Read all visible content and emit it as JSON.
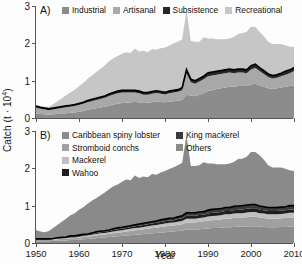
{
  "figure": {
    "ylabel_prefix": "Catch (t · 10",
    "ylabel_exponent": "4",
    "ylabel_suffix": ")",
    "xlabel": "Year",
    "background_color": "#fdfdfd",
    "axis_color": "#555555"
  },
  "panels": [
    {
      "tag": "A)",
      "ytick_labels": [
        "0",
        "1",
        "2",
        "3"
      ],
      "xtick_labels": [
        "1950",
        "1960",
        "1970",
        "1980",
        "1990",
        "2000",
        "2010"
      ],
      "legend_columns": [
        {
          "items": [
            {
              "label": "Industrial",
              "color": "#8c8c8c"
            },
            {
              "label": "Artisanal",
              "color": "#a8a8a8"
            },
            {
              "label": "Subsistence",
              "color": "#262626"
            },
            {
              "label": "Recreational",
              "color": "#c6c6c6"
            }
          ]
        }
      ]
    },
    {
      "tag": "B)",
      "ytick_labels": [
        "0",
        "1",
        "2",
        "3"
      ],
      "xtick_labels": [
        "1950",
        "1960",
        "1970",
        "1980",
        "1990",
        "2000",
        "2010"
      ],
      "legend_columns": [
        {
          "items": [
            {
              "label": "Caribbean spiny lobster",
              "color": "#8c8c8c"
            },
            {
              "label": "Stromboid conchs",
              "color": "#a0a0a0"
            },
            {
              "label": "Mackerel",
              "color": "#c0c0c0"
            },
            {
              "label": "Wahoo",
              "color": "#1f1f1f"
            }
          ]
        },
        {
          "items": [
            {
              "label": "King mackerel",
              "color": "#3a3a3a"
            },
            {
              "label": "Others",
              "color": "#8a8a8a"
            }
          ]
        }
      ]
    }
  ],
  "chart_data": [
    {
      "type": "area",
      "panel": "A",
      "title": "A)",
      "xlabel": "Year",
      "ylabel": "Catch (t · 10^4)",
      "xlim": [
        1950,
        2010
      ],
      "ylim": [
        0,
        3
      ],
      "yticks": [
        0,
        1,
        2,
        3
      ],
      "xticks": [
        1950,
        1960,
        1970,
        1980,
        1990,
        2000,
        2010
      ],
      "grid": false,
      "legend_position": "top",
      "stacked": true,
      "stack_order": [
        "Industrial",
        "Artisanal",
        "Subsistence",
        "Recreational"
      ],
      "x": [
        1950,
        1951,
        1952,
        1953,
        1954,
        1955,
        1956,
        1957,
        1958,
        1959,
        1960,
        1961,
        1962,
        1963,
        1964,
        1965,
        1966,
        1967,
        1968,
        1969,
        1970,
        1971,
        1972,
        1973,
        1974,
        1975,
        1976,
        1977,
        1978,
        1979,
        1980,
        1981,
        1982,
        1983,
        1984,
        1985,
        1986,
        1987,
        1988,
        1989,
        1990,
        1991,
        1992,
        1993,
        1994,
        1995,
        1996,
        1997,
        1998,
        1999,
        2000,
        2001,
        2002,
        2003,
        2004,
        2005,
        2006,
        2007,
        2008,
        2009,
        2010
      ],
      "series": [
        {
          "name": "Industrial",
          "color": "#8c8c8c",
          "values": [
            0.12,
            0.11,
            0.1,
            0.09,
            0.1,
            0.11,
            0.12,
            0.13,
            0.14,
            0.15,
            0.17,
            0.19,
            0.22,
            0.24,
            0.26,
            0.28,
            0.3,
            0.33,
            0.36,
            0.38,
            0.4,
            0.41,
            0.42,
            0.43,
            0.42,
            0.4,
            0.41,
            0.43,
            0.44,
            0.43,
            0.42,
            0.44,
            0.45,
            0.46,
            0.48,
            0.62,
            0.6,
            0.58,
            0.62,
            0.66,
            0.72,
            0.74,
            0.78,
            0.8,
            0.82,
            0.84,
            0.84,
            0.86,
            0.86,
            0.86,
            0.9,
            0.92,
            0.88,
            0.84,
            0.8,
            0.78,
            0.8,
            0.82,
            0.84,
            0.86,
            0.88
          ]
        },
        {
          "name": "Artisanal",
          "color": "#a8a8a8",
          "values": [
            0.16,
            0.14,
            0.13,
            0.12,
            0.13,
            0.14,
            0.15,
            0.16,
            0.16,
            0.17,
            0.18,
            0.19,
            0.2,
            0.21,
            0.22,
            0.23,
            0.24,
            0.26,
            0.27,
            0.28,
            0.28,
            0.27,
            0.26,
            0.25,
            0.24,
            0.22,
            0.21,
            0.22,
            0.23,
            0.22,
            0.21,
            0.22,
            0.23,
            0.24,
            0.26,
            0.58,
            0.36,
            0.34,
            0.36,
            0.38,
            0.4,
            0.4,
            0.38,
            0.38,
            0.38,
            0.38,
            0.36,
            0.36,
            0.36,
            0.34,
            0.4,
            0.42,
            0.38,
            0.34,
            0.3,
            0.28,
            0.28,
            0.3,
            0.32,
            0.34,
            0.38
          ]
        },
        {
          "name": "Subsistence",
          "color": "#262626",
          "values": [
            0.04,
            0.04,
            0.04,
            0.04,
            0.04,
            0.04,
            0.04,
            0.04,
            0.04,
            0.04,
            0.04,
            0.04,
            0.05,
            0.05,
            0.05,
            0.05,
            0.05,
            0.05,
            0.05,
            0.06,
            0.06,
            0.06,
            0.06,
            0.06,
            0.06,
            0.06,
            0.06,
            0.06,
            0.06,
            0.06,
            0.06,
            0.06,
            0.06,
            0.06,
            0.07,
            0.1,
            0.08,
            0.08,
            0.08,
            0.08,
            0.09,
            0.09,
            0.09,
            0.09,
            0.09,
            0.09,
            0.09,
            0.09,
            0.09,
            0.09,
            0.1,
            0.1,
            0.09,
            0.09,
            0.08,
            0.08,
            0.08,
            0.08,
            0.09,
            0.09,
            0.09
          ]
        },
        {
          "name": "Recreational",
          "color": "#c6c6c6",
          "values": [
            0.03,
            0.03,
            0.03,
            0.05,
            0.1,
            0.16,
            0.22,
            0.28,
            0.34,
            0.4,
            0.46,
            0.52,
            0.58,
            0.64,
            0.7,
            0.76,
            0.82,
            0.88,
            0.92,
            0.94,
            0.98,
            1.02,
            1.0,
            1.12,
            1.06,
            1.12,
            1.08,
            1.14,
            1.1,
            1.16,
            1.2,
            1.22,
            1.26,
            1.28,
            1.3,
            1.6,
            1.02,
            1.04,
            0.98,
            1.04,
            0.92,
            0.9,
            0.86,
            0.84,
            0.82,
            0.82,
            0.88,
            0.94,
            0.96,
            1.02,
            1.04,
            1.0,
            0.96,
            0.92,
            0.86,
            0.84,
            0.82,
            0.78,
            0.7,
            0.62,
            0.56
          ]
        }
      ]
    },
    {
      "type": "area",
      "panel": "B",
      "title": "B)",
      "xlabel": "Year",
      "ylabel": "Catch (t · 10^4)",
      "xlim": [
        1950,
        2010
      ],
      "ylim": [
        0,
        3
      ],
      "yticks": [
        0,
        1,
        2,
        3
      ],
      "xticks": [
        1950,
        1960,
        1970,
        1980,
        1990,
        2000,
        2010
      ],
      "grid": false,
      "legend_position": "top",
      "stacked": true,
      "stack_order": [
        "Caribbean spiny lobster",
        "Stromboid conchs",
        "Mackerel",
        "Wahoo",
        "King mackerel",
        "Others"
      ],
      "x": [
        1950,
        1951,
        1952,
        1953,
        1954,
        1955,
        1956,
        1957,
        1958,
        1959,
        1960,
        1961,
        1962,
        1963,
        1964,
        1965,
        1966,
        1967,
        1968,
        1969,
        1970,
        1971,
        1972,
        1973,
        1974,
        1975,
        1976,
        1977,
        1978,
        1979,
        1980,
        1981,
        1982,
        1983,
        1984,
        1985,
        1986,
        1987,
        1988,
        1989,
        1990,
        1991,
        1992,
        1993,
        1994,
        1995,
        1996,
        1997,
        1998,
        1999,
        2000,
        2001,
        2002,
        2003,
        2004,
        2005,
        2006,
        2007,
        2008,
        2009,
        2010
      ],
      "series": [
        {
          "name": "Caribbean spiny lobster",
          "color": "#8c8c8c",
          "values": [
            0.05,
            0.05,
            0.05,
            0.05,
            0.06,
            0.06,
            0.07,
            0.07,
            0.08,
            0.08,
            0.09,
            0.1,
            0.11,
            0.12,
            0.13,
            0.14,
            0.15,
            0.16,
            0.17,
            0.18,
            0.19,
            0.2,
            0.21,
            0.22,
            0.23,
            0.24,
            0.25,
            0.26,
            0.27,
            0.28,
            0.29,
            0.3,
            0.31,
            0.32,
            0.33,
            0.36,
            0.36,
            0.36,
            0.37,
            0.38,
            0.39,
            0.4,
            0.4,
            0.41,
            0.42,
            0.42,
            0.43,
            0.44,
            0.44,
            0.44,
            0.45,
            0.45,
            0.44,
            0.43,
            0.42,
            0.42,
            0.42,
            0.43,
            0.43,
            0.44,
            0.44
          ]
        },
        {
          "name": "Stromboid conchs",
          "color": "#a0a0a0",
          "values": [
            0.03,
            0.03,
            0.03,
            0.03,
            0.03,
            0.04,
            0.04,
            0.04,
            0.05,
            0.05,
            0.05,
            0.06,
            0.06,
            0.07,
            0.07,
            0.08,
            0.08,
            0.09,
            0.09,
            0.1,
            0.1,
            0.11,
            0.11,
            0.12,
            0.12,
            0.13,
            0.13,
            0.14,
            0.14,
            0.15,
            0.15,
            0.16,
            0.16,
            0.17,
            0.17,
            0.19,
            0.19,
            0.19,
            0.2,
            0.2,
            0.21,
            0.21,
            0.22,
            0.22,
            0.23,
            0.23,
            0.24,
            0.24,
            0.24,
            0.25,
            0.25,
            0.25,
            0.24,
            0.24,
            0.23,
            0.23,
            0.23,
            0.23,
            0.24,
            0.24,
            0.24
          ]
        },
        {
          "name": "Mackerel",
          "color": "#c0c0c0",
          "values": [
            0.01,
            0.01,
            0.01,
            0.01,
            0.01,
            0.02,
            0.02,
            0.02,
            0.02,
            0.02,
            0.03,
            0.03,
            0.03,
            0.03,
            0.04,
            0.04,
            0.04,
            0.04,
            0.05,
            0.05,
            0.05,
            0.05,
            0.06,
            0.06,
            0.06,
            0.06,
            0.07,
            0.07,
            0.07,
            0.07,
            0.08,
            0.08,
            0.08,
            0.08,
            0.09,
            0.1,
            0.1,
            0.1,
            0.1,
            0.1,
            0.11,
            0.11,
            0.11,
            0.11,
            0.12,
            0.12,
            0.12,
            0.12,
            0.12,
            0.13,
            0.13,
            0.13,
            0.12,
            0.12,
            0.12,
            0.12,
            0.12,
            0.12,
            0.12,
            0.13,
            0.13
          ]
        },
        {
          "name": "Wahoo",
          "color": "#1f1f1f",
          "values": [
            0.01,
            0.01,
            0.01,
            0.01,
            0.01,
            0.01,
            0.01,
            0.02,
            0.02,
            0.02,
            0.02,
            0.02,
            0.02,
            0.03,
            0.03,
            0.03,
            0.03,
            0.03,
            0.04,
            0.04,
            0.04,
            0.04,
            0.04,
            0.05,
            0.05,
            0.05,
            0.05,
            0.05,
            0.06,
            0.06,
            0.06,
            0.06,
            0.06,
            0.07,
            0.07,
            0.08,
            0.08,
            0.08,
            0.08,
            0.08,
            0.08,
            0.09,
            0.09,
            0.09,
            0.09,
            0.09,
            0.09,
            0.09,
            0.1,
            0.1,
            0.1,
            0.1,
            0.09,
            0.09,
            0.09,
            0.09,
            0.09,
            0.09,
            0.09,
            0.09,
            0.09
          ]
        },
        {
          "name": "King mackerel",
          "color": "#3a3a3a",
          "values": [
            0.01,
            0.01,
            0.01,
            0.01,
            0.01,
            0.01,
            0.01,
            0.01,
            0.02,
            0.02,
            0.02,
            0.02,
            0.02,
            0.02,
            0.03,
            0.03,
            0.03,
            0.03,
            0.03,
            0.04,
            0.04,
            0.04,
            0.04,
            0.04,
            0.05,
            0.05,
            0.05,
            0.05,
            0.05,
            0.06,
            0.06,
            0.06,
            0.06,
            0.06,
            0.07,
            0.08,
            0.08,
            0.08,
            0.08,
            0.08,
            0.09,
            0.09,
            0.09,
            0.09,
            0.09,
            0.09,
            0.1,
            0.1,
            0.1,
            0.1,
            0.1,
            0.1,
            0.1,
            0.09,
            0.09,
            0.09,
            0.09,
            0.09,
            0.09,
            0.1,
            0.1
          ]
        },
        {
          "name": "Others",
          "color": "#8a8a8a",
          "values": [
            0.24,
            0.2,
            0.18,
            0.21,
            0.28,
            0.35,
            0.42,
            0.49,
            0.55,
            0.61,
            0.68,
            0.73,
            0.81,
            0.86,
            0.9,
            0.96,
            1.02,
            1.09,
            1.14,
            1.16,
            1.22,
            1.26,
            1.22,
            1.32,
            1.23,
            1.25,
            1.21,
            1.28,
            1.24,
            1.27,
            1.29,
            1.32,
            1.36,
            1.38,
            1.42,
            2.09,
            1.25,
            1.25,
            1.25,
            1.32,
            1.25,
            1.23,
            1.2,
            1.19,
            1.16,
            1.18,
            1.19,
            1.26,
            1.26,
            1.29,
            1.41,
            1.41,
            1.36,
            1.26,
            1.13,
            1.07,
            1.07,
            1.06,
            1.02,
            0.95,
            0.93
          ]
        }
      ]
    }
  ]
}
